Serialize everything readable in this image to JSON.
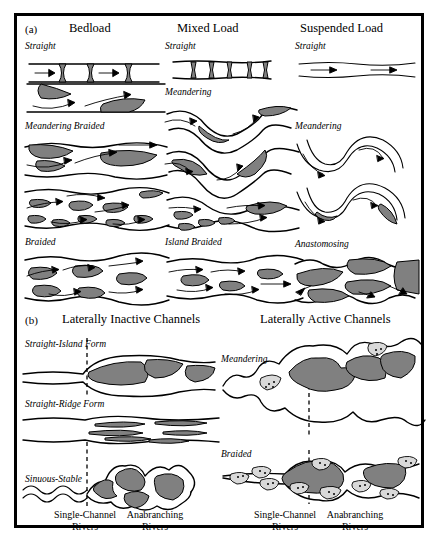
{
  "figure": {
    "panel_a": {
      "id": "(a)",
      "columns": [
        {
          "heading": "Bedload",
          "rows": [
            "Straight",
            "Meandering Braided",
            "Braided"
          ]
        },
        {
          "heading": "Mixed Load",
          "rows": [
            "Straight",
            "Meandering",
            "Island Braided"
          ]
        },
        {
          "heading": "Suspended Load",
          "rows": [
            "Straight",
            "Meandering",
            "Anastomosing"
          ]
        }
      ]
    },
    "panel_b": {
      "id": "(b)",
      "groups": [
        {
          "heading": "Laterally Inactive Channels",
          "rows": [
            "Straight-Island Form",
            "Straight-Ridge Form",
            "Sinuous-Stable"
          ],
          "footer_left": "Single-Channel\nRivers",
          "footer_left_l1": "Single-Channel",
          "footer_left_l2": "Rivers",
          "footer_right_l1": "Anabranching",
          "footer_right_l2": "Rivers"
        },
        {
          "heading": "Laterally Active Channels",
          "rows": [
            "Meandering",
            "Braided"
          ],
          "footer_left_l1": "Single-Channel",
          "footer_left_l2": "Rivers",
          "footer_right_l1": "Anabranching",
          "footer_right_l2": "Rivers"
        }
      ]
    },
    "colors": {
      "bar_fill": "#808080",
      "bar_light_fill": "#d9d9d9",
      "line": "#000000",
      "background": "#ffffff"
    }
  }
}
